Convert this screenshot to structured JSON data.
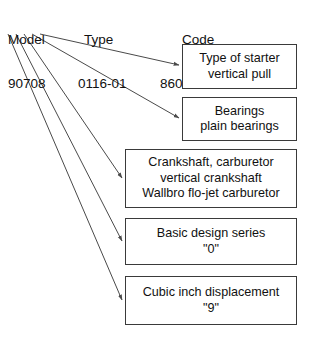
{
  "diagram": {
    "line_color": "#4a4a4a",
    "box_border_color": "#3a3a3a",
    "background_color": "#ffffff",
    "text_color": "#111111"
  },
  "header": {
    "fields": [
      {
        "label": "Model",
        "value": "90708"
      },
      {
        "label": "Type",
        "value": "0116-01"
      },
      {
        "label": "Code",
        "value": "86022004"
      }
    ]
  },
  "callouts": [
    {
      "lines": [
        "Type of starter",
        "vertical pull"
      ]
    },
    {
      "lines": [
        "Bearings",
        "plain bearings"
      ]
    },
    {
      "lines": [
        "Crankshaft, carburetor",
        "vertical crankshaft",
        "Wallbro flo-jet carburetor"
      ]
    },
    {
      "lines": [
        "Basic design series",
        "\"0\""
      ]
    },
    {
      "lines": [
        "Cubic inch displacement",
        "\"9\""
      ]
    }
  ]
}
